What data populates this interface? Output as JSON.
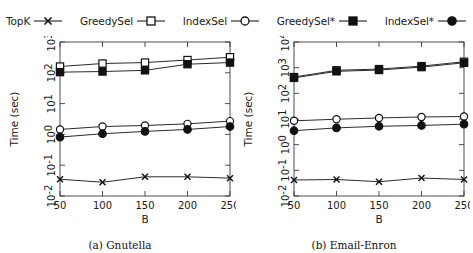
{
  "figure": {
    "legend": [
      {
        "label": "TopK",
        "marker": "cross-marker",
        "filled": false
      },
      {
        "label": "GreedySel",
        "marker": "open-square-marker",
        "filled": false
      },
      {
        "label": "IndexSel",
        "marker": "open-circle-marker",
        "filled": false
      },
      {
        "label": "GreedySel*",
        "marker": "filled-square-marker",
        "filled": true
      },
      {
        "label": "IndexSel*",
        "marker": "filled-circle-marker",
        "filled": true
      }
    ],
    "captions": {
      "a": "(a) Gnutella",
      "b": "(b) Email-Enron"
    }
  },
  "chart_data": [
    {
      "type": "line",
      "title": "(a) Gnutella",
      "xlabel": "B",
      "ylabel": "Time (sec)",
      "x": [
        50,
        100,
        150,
        200,
        250
      ],
      "xlim": [
        50,
        250
      ],
      "xticks": [
        50,
        100,
        150,
        200,
        250
      ],
      "xtick_labels": [
        "50",
        "100",
        "150",
        "200",
        "250"
      ],
      "yscale": "log",
      "ylim": [
        0.01,
        1000
      ],
      "yticks": [
        0.01,
        0.1,
        1,
        10,
        100,
        1000
      ],
      "ytick_labels": [
        "10^-2",
        "10^-1",
        "10^0",
        "10^1",
        "10^2",
        "10^3"
      ],
      "grid": false,
      "legend_position": "above-figure",
      "series": [
        {
          "name": "TopK",
          "marker": "cross-marker",
          "values": [
            0.035,
            0.028,
            0.042,
            0.042,
            0.038
          ]
        },
        {
          "name": "GreedySel",
          "marker": "open-square-marker",
          "values": [
            160,
            200,
            215,
            260,
            320
          ]
        },
        {
          "name": "IndexSel",
          "marker": "open-circle-marker",
          "values": [
            1.45,
            1.8,
            1.95,
            2.2,
            2.7
          ]
        },
        {
          "name": "GreedySel*",
          "marker": "filled-square-marker",
          "values": [
            105,
            110,
            120,
            190,
            215
          ]
        },
        {
          "name": "IndexSel*",
          "marker": "filled-circle-marker",
          "values": [
            0.82,
            1.05,
            1.25,
            1.45,
            1.8
          ]
        }
      ]
    },
    {
      "type": "line",
      "title": "(b) Email-Enron",
      "xlabel": "B",
      "ylabel": "Time (sec)",
      "x": [
        50,
        100,
        150,
        200,
        250
      ],
      "xlim": [
        50,
        250
      ],
      "xticks": [
        50,
        100,
        150,
        200,
        250
      ],
      "xtick_labels": [
        "50",
        "100",
        "150",
        "200",
        "250"
      ],
      "yscale": "log",
      "ylim": [
        0.01,
        10000
      ],
      "yticks": [
        0.01,
        0.1,
        1,
        10,
        100,
        1000,
        10000
      ],
      "ytick_labels": [
        "10^-2",
        "10^-1",
        "10^0",
        "10^1",
        "10^2",
        "10^3",
        "10^4"
      ],
      "grid": false,
      "legend_position": "above-figure",
      "series": [
        {
          "name": "TopK",
          "marker": "cross-marker",
          "values": [
            0.042,
            0.044,
            0.036,
            0.05,
            0.044
          ]
        },
        {
          "name": "GreedySel",
          "marker": "open-square-marker",
          "values": [
            430,
            790,
            880,
            1150,
            1700
          ]
        },
        {
          "name": "IndexSel",
          "marker": "open-circle-marker",
          "values": [
            8.5,
            9.8,
            11.0,
            12.0,
            12.5
          ]
        },
        {
          "name": "GreedySel*",
          "marker": "filled-square-marker",
          "values": [
            400,
            720,
            810,
            1050,
            1550
          ]
        },
        {
          "name": "IndexSel*",
          "marker": "filled-circle-marker",
          "values": [
            3.5,
            4.5,
            5.2,
            5.6,
            6.3
          ]
        }
      ]
    }
  ]
}
